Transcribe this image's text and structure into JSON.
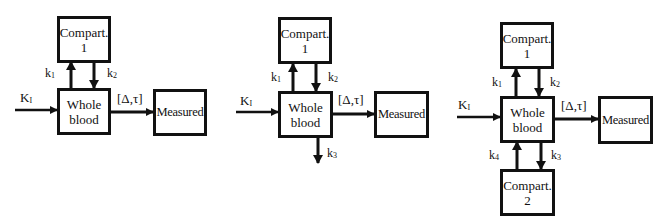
{
  "figure": {
    "diagrams": [
      {
        "id": "model-1",
        "boxes": {
          "compartment1": {
            "line1": "Compart.",
            "line2": "1"
          },
          "whole_blood": {
            "line1": "Whole",
            "line2": "blood"
          },
          "measured": {
            "label": "Measured"
          }
        },
        "labels": {
          "input": "K",
          "input_sub": "I",
          "k1": "k",
          "k1_sub": "1",
          "k2": "k",
          "k2_sub": "2",
          "delay": "[Δ,τ]"
        }
      },
      {
        "id": "model-2",
        "boxes": {
          "compartment1": {
            "line1": "Compart.",
            "line2": "1"
          },
          "whole_blood": {
            "line1": "Whole",
            "line2": "blood"
          },
          "measured": {
            "label": "Measured"
          }
        },
        "labels": {
          "input": "K",
          "input_sub": "I",
          "k1": "k",
          "k1_sub": "1",
          "k2": "k",
          "k2_sub": "2",
          "k3": "k",
          "k3_sub": "3",
          "delay": "[Δ,τ]"
        }
      },
      {
        "id": "model-3",
        "boxes": {
          "compartment1": {
            "line1": "Compart.",
            "line2": "1"
          },
          "compartment2": {
            "line1": "Compart.",
            "line2": "2"
          },
          "whole_blood": {
            "line1": "Whole",
            "line2": "blood"
          },
          "measured": {
            "label": "Measured"
          }
        },
        "labels": {
          "input": "K",
          "input_sub": "I",
          "k1": "k",
          "k1_sub": "1",
          "k2": "k",
          "k2_sub": "2",
          "k3": "k",
          "k3_sub": "3",
          "k4": "k",
          "k4_sub": "4",
          "delay": "[Δ,τ]"
        }
      }
    ]
  }
}
